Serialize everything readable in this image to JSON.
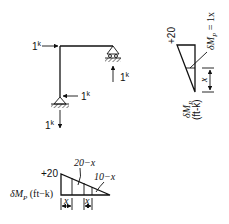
{
  "frame": {
    "top_load_label": "1",
    "top_load_unit": "k",
    "right_reaction_label": "1",
    "right_reaction_unit": "k",
    "bottom_reaction_h_label": "1",
    "bottom_reaction_h_unit": "k",
    "bottom_reaction_v_label": "1",
    "bottom_reaction_v_unit": "k"
  },
  "column_diagram": {
    "top_value": "+20",
    "moment_label": "δM",
    "moment_sub": "P",
    "moment_eq": " = 1x",
    "units_label": "δM",
    "units_sub": "P",
    "units_text": "(ft-k)",
    "dim_label": "x"
  },
  "beam_diagram": {
    "left_value": "+20",
    "label_a": "20−x",
    "label_b": "10−x",
    "units_prefix": "δM",
    "units_sub": "P",
    "units_text": " (ft−k)",
    "dim_label_1": "x",
    "dim_label_2": "x"
  }
}
